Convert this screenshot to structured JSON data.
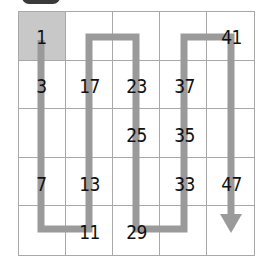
{
  "grid": {
    "rows": 5,
    "cols": 5,
    "highlight_cell": [
      0,
      0
    ],
    "cells": [
      [
        "1",
        "",
        "",
        "",
        "41"
      ],
      [
        "3",
        "17",
        "23",
        "37",
        ""
      ],
      [
        "",
        "",
        "25",
        "35",
        ""
      ],
      [
        "7",
        "13",
        "",
        "33",
        "47"
      ],
      [
        "",
        "11",
        "29",
        "",
        ""
      ]
    ]
  },
  "path": {
    "color": "#9a9a9a",
    "description": "serpentine path starting at cell 1 going down column 1, up column 2, down column 3, up column 4, down column 5 ending in arrow",
    "end_marker": "arrow-down"
  },
  "numbers": [
    {
      "label": "1",
      "row": 0,
      "col": 0
    },
    {
      "label": "41",
      "row": 0,
      "col": 4
    },
    {
      "label": "3",
      "row": 1,
      "col": 0
    },
    {
      "label": "17",
      "row": 1,
      "col": 1
    },
    {
      "label": "23",
      "row": 1,
      "col": 2
    },
    {
      "label": "37",
      "row": 1,
      "col": 3
    },
    {
      "label": "25",
      "row": 2,
      "col": 2
    },
    {
      "label": "35",
      "row": 2,
      "col": 3
    },
    {
      "label": "7",
      "row": 3,
      "col": 0
    },
    {
      "label": "13",
      "row": 3,
      "col": 1
    },
    {
      "label": "33",
      "row": 3,
      "col": 3
    },
    {
      "label": "47",
      "row": 3,
      "col": 4
    },
    {
      "label": "11",
      "row": 4,
      "col": 1
    },
    {
      "label": "29",
      "row": 4,
      "col": 2
    }
  ]
}
